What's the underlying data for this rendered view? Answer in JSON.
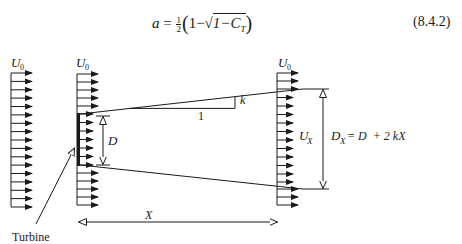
{
  "equation": {
    "lhs": "a",
    "eq": "=",
    "frac_num": "1",
    "frac_den": "2",
    "open": "(",
    "one": "1",
    "minus": "−",
    "sqrt_sym": "√",
    "sqrt_content": "1−C",
    "sub": "T",
    "close": ")",
    "number": "(8.4.2)"
  },
  "diagram": {
    "labels": {
      "u0_left": "U",
      "u0_left_sub": "0",
      "u0_mid": "U",
      "u0_mid_sub": "0",
      "u0_right": "U",
      "u0_right_sub": "0",
      "ux": "U",
      "ux_sub": "X",
      "d": "D",
      "slope_k": "k",
      "slope_1": "1",
      "dx_lhs": "D",
      "dx_sub": "X",
      "dx_rhs": "= D  + 2 kX",
      "x": "X",
      "turbine": "Turbine"
    },
    "colors": {
      "ink": "#1a1a1a",
      "background": "#ffffff"
    }
  }
}
